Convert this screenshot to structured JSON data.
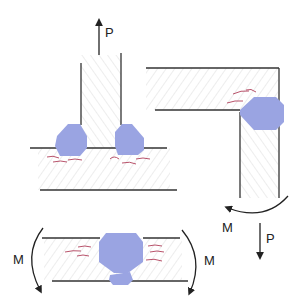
{
  "diagram": {
    "type": "welded joints under load",
    "colors": {
      "weld": "#9aa4e2",
      "crack": "#b0405a",
      "line": "#333333",
      "hatch": "#dddddd"
    },
    "t_joint": {
      "load_label": "P",
      "load_direction": "up"
    },
    "corner_joint": {
      "moment_label": "M",
      "load_label": "P",
      "load_direction": "down"
    },
    "butt_joint": {
      "left_moment_label": "M",
      "right_moment_label": "M"
    }
  }
}
